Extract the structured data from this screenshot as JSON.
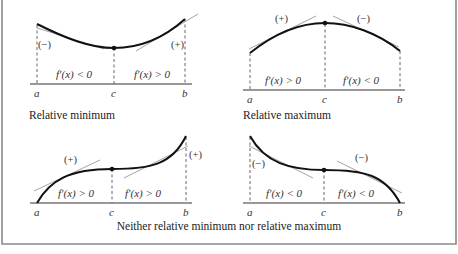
{
  "figure": {
    "panels": [
      {
        "id": "relative-minimum",
        "caption": "Relative minimum",
        "points": {
          "a": "a",
          "c": "c",
          "b": "b"
        },
        "left_sign": "(−)",
        "right_sign": "(+)",
        "left_derivative": "f′(x) < 0",
        "right_derivative": "f′(x) > 0"
      },
      {
        "id": "relative-maximum",
        "caption": "Relative maximum",
        "points": {
          "a": "a",
          "c": "c",
          "b": "b"
        },
        "left_sign": "(+)",
        "right_sign": "(−)",
        "left_derivative": "f′(x) > 0",
        "right_derivative": "f′(x) < 0"
      },
      {
        "id": "neither-increasing",
        "points": {
          "a": "a",
          "c": "c",
          "b": "b"
        },
        "left_sign": "(+)",
        "right_sign": "(+)",
        "left_derivative": "f′(x) > 0",
        "right_derivative": "f′(x) > 0"
      },
      {
        "id": "neither-decreasing",
        "points": {
          "a": "a",
          "c": "c",
          "b": "b"
        },
        "left_sign": "(−)",
        "right_sign": "(−)",
        "left_derivative": "f′(x) < 0",
        "right_derivative": "f′(x) < 0"
      }
    ],
    "bottom_caption": "Neither relative minimum nor relative maximum"
  }
}
